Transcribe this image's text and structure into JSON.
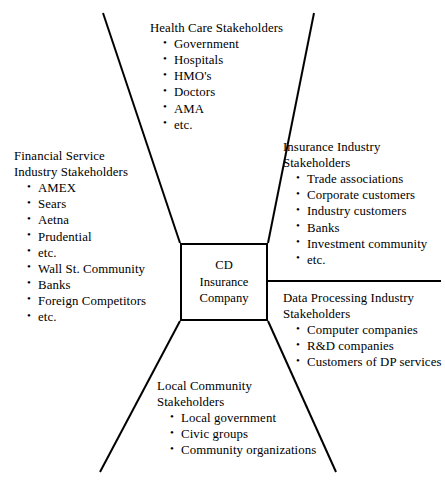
{
  "diagram": {
    "type": "stakeholder-map",
    "center": {
      "lines": [
        "CD",
        "Insurance",
        "Company"
      ]
    },
    "groups": [
      {
        "id": "health-care",
        "heading": [
          "Health Care Stakeholders"
        ],
        "items": [
          "Government",
          "Hospitals",
          "HMO's",
          "Doctors",
          "AMA",
          "etc."
        ]
      },
      {
        "id": "financial",
        "heading": [
          "Financial Service",
          "Industry Stakeholders"
        ],
        "items": [
          "AMEX",
          "Sears",
          "Aetna",
          "Prudential",
          "etc.",
          "Wall St. Community",
          "Banks",
          "Foreign Competitors",
          "etc."
        ]
      },
      {
        "id": "insurance",
        "heading": [
          "Insurance Industry",
          "Stakeholders"
        ],
        "items": [
          "Trade associations",
          "Corporate customers",
          "Industry customers",
          "Banks",
          "Investment community",
          "etc."
        ]
      },
      {
        "id": "data-processing",
        "heading": [
          "Data Processing Industry",
          "Stakeholders"
        ],
        "items": [
          "Computer companies",
          "R&D companies",
          "Customers of DP services"
        ]
      },
      {
        "id": "local-community",
        "heading": [
          "Local Community",
          "Stakeholders"
        ],
        "items": [
          "Local government",
          "Civic groups",
          "Community organizations"
        ]
      }
    ],
    "bullet_glyph": "•",
    "colors": {
      "ink": "#000000",
      "background": "#ffffff"
    }
  }
}
